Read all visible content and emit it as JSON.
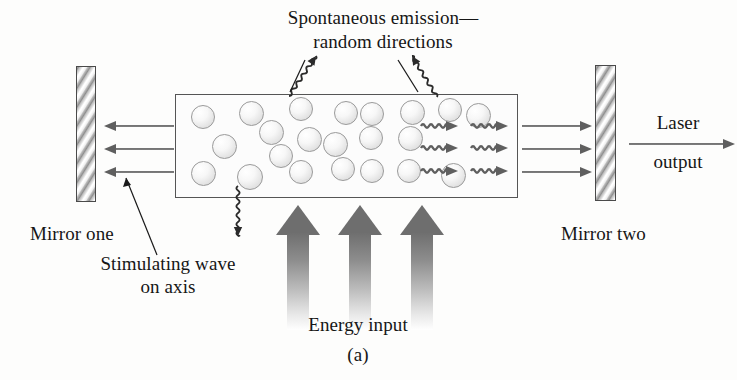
{
  "figure": {
    "caption": "(a)",
    "title_note": "Laser cavity schematic"
  },
  "labels": {
    "spontaneous_line1": "Spontaneous emission—",
    "spontaneous_line2": "random directions",
    "mirror_one": "Mirror one",
    "mirror_two": "Mirror two",
    "stimulating_line1": "Stimulating wave",
    "stimulating_line2": "on axis",
    "energy_input": "Energy input",
    "laser_line1": "Laser",
    "laser_line2": "output"
  },
  "colors": {
    "background": "#fdfdfc",
    "text": "#161616",
    "outline": "#555555",
    "arrow_gray": "#5f5f5f",
    "energy_arrow_dark": "#6e6e6e",
    "atom_border": "#9a9a9a",
    "mirror_dark": "#8f8f8f"
  },
  "geometry": {
    "mirror_one": {
      "x": 76,
      "y": 66,
      "w": 20,
      "h": 136
    },
    "mirror_two": {
      "x": 595,
      "y": 65,
      "w": 21,
      "h": 136
    },
    "medium_box": {
      "x": 175,
      "y": 94,
      "w": 343,
      "h": 104
    }
  },
  "atoms": [
    {
      "x": 190,
      "y": 104,
      "d": 24
    },
    {
      "x": 238,
      "y": 100,
      "d": 25
    },
    {
      "x": 288,
      "y": 96,
      "d": 24
    },
    {
      "x": 333,
      "y": 100,
      "d": 24
    },
    {
      "x": 359,
      "y": 101,
      "d": 24
    },
    {
      "x": 399,
      "y": 99,
      "d": 25
    },
    {
      "x": 437,
      "y": 97,
      "d": 24
    },
    {
      "x": 465,
      "y": 102,
      "d": 25
    },
    {
      "x": 258,
      "y": 119,
      "d": 25
    },
    {
      "x": 211,
      "y": 133,
      "d": 25
    },
    {
      "x": 268,
      "y": 143,
      "d": 24
    },
    {
      "x": 296,
      "y": 126,
      "d": 25
    },
    {
      "x": 322,
      "y": 131,
      "d": 25
    },
    {
      "x": 358,
      "y": 125,
      "d": 24
    },
    {
      "x": 397,
      "y": 125,
      "d": 25
    },
    {
      "x": 190,
      "y": 160,
      "d": 25
    },
    {
      "x": 236,
      "y": 163,
      "d": 26
    },
    {
      "x": 288,
      "y": 159,
      "d": 24
    },
    {
      "x": 330,
      "y": 156,
      "d": 24
    },
    {
      "x": 359,
      "y": 158,
      "d": 24
    },
    {
      "x": 396,
      "y": 158,
      "d": 24
    },
    {
      "x": 440,
      "y": 162,
      "d": 25
    }
  ],
  "beams": {
    "left_of_box": [
      {
        "x": 104,
        "y": 124,
        "len": 70
      },
      {
        "x": 104,
        "y": 147,
        "len": 70
      },
      {
        "x": 104,
        "y": 170,
        "len": 70
      }
    ],
    "right_of_box": [
      {
        "x": 522,
        "y": 124,
        "len": 70
      },
      {
        "x": 522,
        "y": 147,
        "len": 70
      },
      {
        "x": 522,
        "y": 170,
        "len": 70
      }
    ],
    "count_per_side": 3
  },
  "wave_arrows": {
    "rows_y": [
      125,
      147,
      170
    ],
    "cols_x": [
      420,
      470
    ],
    "count": 6,
    "direction": "right"
  },
  "squiggles": [
    {
      "name": "spontaneous-up-left",
      "from_x": 289,
      "from_y": 96,
      "to_x": 316,
      "to_y": 56,
      "direction": "up-right"
    },
    {
      "name": "spontaneous-up-right",
      "from_x": 437,
      "from_y": 97,
      "to_x": 412,
      "to_y": 56,
      "direction": "up-left"
    },
    {
      "name": "spontaneous-down",
      "from_x": 238,
      "from_y": 186,
      "to_x": 238,
      "to_y": 236,
      "direction": "down"
    }
  ],
  "energy_arrows": [
    {
      "x": 276,
      "y": 205,
      "h": 125
    },
    {
      "x": 338,
      "y": 205,
      "h": 125
    },
    {
      "x": 400,
      "y": 205,
      "h": 125
    }
  ]
}
